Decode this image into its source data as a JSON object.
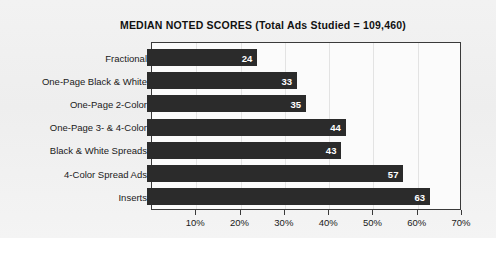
{
  "chart_data": {
    "type": "bar",
    "orientation": "horizontal",
    "title": "MEDIAN NOTED SCORES (Total Ads Studied = 109,460)",
    "xlabel": "",
    "ylabel": "",
    "categories": [
      "Fractional",
      "One-Page Black & White",
      "One-Page 2-Color",
      "One-Page 3- & 4-Color",
      "Black & White Spreads",
      "4-Color Spread Ads",
      "Inserts"
    ],
    "values": [
      24,
      33,
      35,
      44,
      43,
      57,
      63
    ],
    "value_labels": [
      "24",
      "33",
      "35",
      "44",
      "43",
      "57",
      "63"
    ],
    "xlim": [
      0,
      70
    ],
    "xticks": [
      10,
      20,
      30,
      40,
      50,
      60,
      70
    ],
    "xtick_labels": [
      "10%",
      "20%",
      "30%",
      "40%",
      "50%",
      "60%",
      "70%"
    ],
    "grid": true,
    "legend": "none",
    "bar_color": "#2b2b2b",
    "value_label_color": "#ffffff",
    "plot_background": "#fbfbfb",
    "page_background": "#f0f0f0"
  }
}
